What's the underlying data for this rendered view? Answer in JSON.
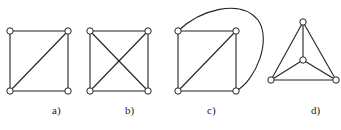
{
  "figure": {
    "graphs": [
      {
        "id": "a",
        "label": "a)",
        "nodes": [
          [
            10,
            31
          ],
          [
            68,
            31
          ],
          [
            10,
            91
          ],
          [
            68,
            91
          ]
        ],
        "edges": [
          [
            0,
            1
          ],
          [
            1,
            3
          ],
          [
            3,
            2
          ],
          [
            2,
            0
          ],
          [
            2,
            1
          ]
        ],
        "curves": []
      },
      {
        "id": "b",
        "label": "b)",
        "nodes": [
          [
            90,
            31
          ],
          [
            148,
            31
          ],
          [
            90,
            91
          ],
          [
            148,
            91
          ]
        ],
        "edges": [
          [
            0,
            1
          ],
          [
            1,
            3
          ],
          [
            3,
            2
          ],
          [
            2,
            0
          ],
          [
            2,
            1
          ],
          [
            0,
            3
          ]
        ],
        "curves": []
      },
      {
        "id": "c",
        "label": "c)",
        "nodes": [
          [
            178,
            31
          ],
          [
            236,
            31
          ],
          [
            178,
            91
          ],
          [
            236,
            91
          ]
        ],
        "edges": [
          [
            0,
            1
          ],
          [
            1,
            3
          ],
          [
            3,
            2
          ],
          [
            2,
            0
          ],
          [
            2,
            1
          ]
        ],
        "curves": [
          {
            "from": 0,
            "to": 3,
            "path": "M178,31 C200,10 240,-2 258,20 C272,40 256,80 236,91"
          }
        ]
      },
      {
        "id": "d",
        "label": "d)",
        "nodes": [
          [
            303,
            22
          ],
          [
            303,
            60
          ],
          [
            271,
            80
          ],
          [
            336,
            80
          ]
        ],
        "edges": [
          [
            0,
            2
          ],
          [
            0,
            3
          ],
          [
            2,
            3
          ],
          [
            0,
            1
          ],
          [
            1,
            2
          ],
          [
            1,
            3
          ]
        ],
        "curves": []
      }
    ],
    "labels": [
      {
        "text": "a)",
        "x": 52,
        "y": 104
      },
      {
        "text": "b)",
        "x": 125,
        "y": 104
      },
      {
        "text": "c)",
        "x": 207,
        "y": 104
      },
      {
        "text": "d)",
        "x": 311,
        "y": 104
      }
    ],
    "colors": {
      "stroke": "#222222",
      "background": "#ffffff"
    }
  }
}
